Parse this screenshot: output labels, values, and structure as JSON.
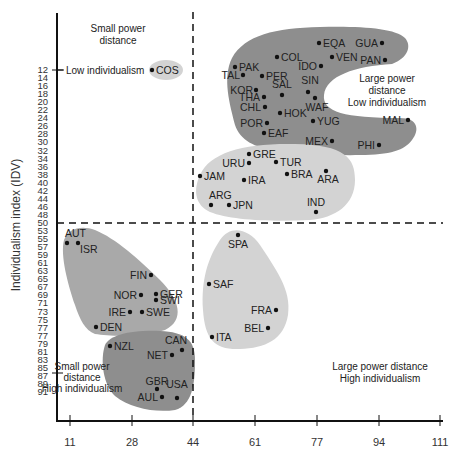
{
  "chart_data": {
    "type": "scatter",
    "title": "",
    "xlabel": "Power distance index (PDI)",
    "ylabel": "Individualism index (IDV)",
    "x_ticks": [
      11,
      28,
      44,
      61,
      77,
      94,
      111
    ],
    "y_ticks": [
      12,
      14,
      16,
      18,
      20,
      22,
      24,
      26,
      28,
      30,
      32,
      34,
      36,
      38,
      40,
      42,
      44,
      46,
      48,
      50,
      53,
      55,
      57,
      59,
      61,
      63,
      65,
      67,
      69,
      71,
      73,
      75,
      77,
      77,
      79,
      81,
      83,
      85,
      87,
      89,
      91
    ],
    "xlim": [
      11,
      111
    ],
    "ylim": [
      12,
      91
    ],
    "y_inverted": true,
    "grid": false,
    "divider_lines": {
      "x": 44,
      "y": 50
    },
    "quadrant_labels": [
      {
        "text": "Small power distance",
        "position": "top-left"
      },
      {
        "text": "Low individualism",
        "position": "top-left-axis"
      },
      {
        "text": "Large power distance Low individualism",
        "position": "top-right"
      },
      {
        "text": "Small power distance High individualism",
        "position": "bottom-left"
      },
      {
        "text": "Large power distance High individualism",
        "position": "bottom-right"
      }
    ],
    "clusters": [
      {
        "name": "Small power distance / low individualism",
        "shade": "light",
        "points": [
          {
            "label": "COS",
            "pdi": 35,
            "idv": 12
          }
        ]
      },
      {
        "name": "Large power distance / low individualism",
        "shade": "dark",
        "points": [
          {
            "label": "EQA",
            "pdi": 78,
            "idv": 8
          },
          {
            "label": "GUA",
            "pdi": 95,
            "idv": 8
          },
          {
            "label": "COL",
            "pdi": 67,
            "idv": 13
          },
          {
            "label": "VEN",
            "pdi": 81,
            "idv": 12
          },
          {
            "label": "PAN",
            "pdi": 95,
            "idv": 13
          },
          {
            "label": "PAK",
            "pdi": 55,
            "idv": 14
          },
          {
            "label": "IDO",
            "pdi": 78,
            "idv": 14
          },
          {
            "label": "TAL",
            "pdi": 58,
            "idv": 17
          },
          {
            "label": "PER",
            "pdi": 64,
            "idv": 16
          },
          {
            "label": "KOR",
            "pdi": 60,
            "idv": 18
          },
          {
            "label": "SAL",
            "pdi": 66,
            "idv": 19
          },
          {
            "label": "SIN",
            "pdi": 74,
            "idv": 20
          },
          {
            "label": "THA",
            "pdi": 64,
            "idv": 20
          },
          {
            "label": "WAF",
            "pdi": 77,
            "idv": 20
          },
          {
            "label": "CHL",
            "pdi": 63,
            "idv": 23
          },
          {
            "label": "HOK",
            "pdi": 68,
            "idv": 25
          },
          {
            "label": "YUG",
            "pdi": 76,
            "idv": 27
          },
          {
            "label": "POR",
            "pdi": 63,
            "idv": 27
          },
          {
            "label": "MAL",
            "pdi": 104,
            "idv": 26
          },
          {
            "label": "EAF",
            "pdi": 64,
            "idv": 27
          },
          {
            "label": "MEX",
            "pdi": 81,
            "idv": 30
          },
          {
            "label": "PHI",
            "pdi": 94,
            "idv": 32
          }
        ]
      },
      {
        "name": "Large power distance / medium individualism",
        "shade": "light",
        "points": [
          {
            "label": "GRE",
            "pdi": 60,
            "idv": 35
          },
          {
            "label": "URU",
            "pdi": 61,
            "idv": 36
          },
          {
            "label": "TUR",
            "pdi": 66,
            "idv": 37
          },
          {
            "label": "JAM",
            "pdi": 45,
            "idv": 39
          },
          {
            "label": "IRA",
            "pdi": 58,
            "idv": 41
          },
          {
            "label": "BRA",
            "pdi": 69,
            "idv": 38
          },
          {
            "label": "ARA",
            "pdi": 80,
            "idv": 38
          },
          {
            "label": "ARG",
            "pdi": 49,
            "idv": 46
          },
          {
            "label": "JPN",
            "pdi": 54,
            "idv": 46
          },
          {
            "label": "IND",
            "pdi": 77,
            "idv": 48
          }
        ]
      },
      {
        "name": "Small power distance / high individualism (continental)",
        "shade": "medium",
        "points": [
          {
            "label": "AUT",
            "pdi": 11,
            "idv": 55
          },
          {
            "label": "ISR",
            "pdi": 13,
            "idv": 54
          },
          {
            "label": "FIN",
            "pdi": 33,
            "idv": 63
          },
          {
            "label": "GER",
            "pdi": 35,
            "idv": 67
          },
          {
            "label": "NOR",
            "pdi": 31,
            "idv": 69
          },
          {
            "label": "SWI",
            "pdi": 34,
            "idv": 68
          },
          {
            "label": "IRE",
            "pdi": 28,
            "idv": 70
          },
          {
            "label": "SWE",
            "pdi": 31,
            "idv": 71
          },
          {
            "label": "DEN",
            "pdi": 18,
            "idv": 74
          }
        ]
      },
      {
        "name": "Small power distance / high individualism (anglo)",
        "shade": "dark",
        "points": [
          {
            "label": "NZL",
            "pdi": 22,
            "idv": 79
          },
          {
            "label": "CAN",
            "pdi": 39,
            "idv": 80
          },
          {
            "label": "NET",
            "pdi": 38,
            "idv": 80
          },
          {
            "label": "GBR",
            "pdi": 35,
            "idv": 89
          },
          {
            "label": "USA",
            "pdi": 40,
            "idv": 91
          },
          {
            "label": "AUL",
            "pdi": 36,
            "idv": 90
          }
        ]
      },
      {
        "name": "Large power distance / high individualism",
        "shade": "light",
        "points": [
          {
            "label": "SPA",
            "pdi": 57,
            "idv": 51
          },
          {
            "label": "SAF",
            "pdi": 49,
            "idv": 65
          },
          {
            "label": "FRA",
            "pdi": 68,
            "idv": 71
          },
          {
            "label": "BEL",
            "pdi": 65,
            "idv": 75
          },
          {
            "label": "ITA",
            "pdi": 50,
            "idv": 76
          }
        ]
      }
    ],
    "legend": null
  },
  "labels": {
    "y_axis_title": "Individualism index (IDV)",
    "small_pd_top": [
      "Small power",
      "distance"
    ],
    "low_indiv_axis": "Low individualism",
    "large_pd_low_ind": [
      "Large power",
      "distance",
      "Low individualism"
    ],
    "small_pd_high_ind": [
      "Small power",
      "distance",
      "High individualism"
    ],
    "large_pd_high_ind": [
      "Large power distance",
      "High individualism"
    ]
  },
  "colors": {
    "dark_blob": "#8e8e8e",
    "medium_blob": "#a9a9a9",
    "light_blob": "#d3d3d3",
    "point": "#111111",
    "axis": "#111111"
  }
}
